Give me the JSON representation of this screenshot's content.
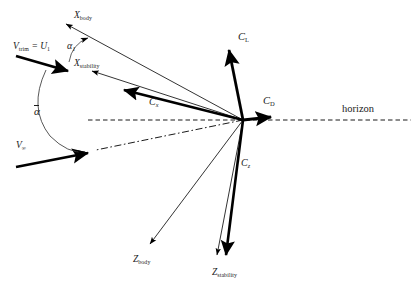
{
  "figure": {
    "origin": {
      "x": 243,
      "y": 120
    },
    "background": "#ffffff",
    "stroke_color": "#000000",
    "text_color": "#1a1a1a"
  },
  "labels": {
    "x_body": {
      "text": "X",
      "sub": "body",
      "x": 74,
      "y": 11
    },
    "x_stability": {
      "text": "X",
      "sub": "stability",
      "x": 74,
      "y": 59
    },
    "v_trim": {
      "text": "V",
      "sub": "trim",
      "eq": " = ",
      "second": "U",
      "sub2": "1",
      "x": 13,
      "y": 42
    },
    "v_inf": {
      "text": "V",
      "sub": "∞",
      "x": 16,
      "y": 141
    },
    "alpha_1": {
      "text": "α",
      "sub": "1",
      "x": 67,
      "y": 41
    },
    "alpha_bar": {
      "text": "α",
      "x": 34,
      "y": 106
    },
    "c_x": {
      "text": "C",
      "sub": "x",
      "x": 149,
      "y": 97
    },
    "c_l": {
      "text": "C",
      "sub": "L",
      "x": 238,
      "y": 32
    },
    "c_d": {
      "text": "C",
      "sub": "D",
      "x": 263,
      "y": 96
    },
    "c_z": {
      "text": "C",
      "sub": "z",
      "x": 241,
      "y": 158
    },
    "z_body": {
      "text": "Z",
      "sub": "body",
      "x": 133,
      "y": 255
    },
    "z_stability": {
      "text": "Z",
      "sub": "stability",
      "x": 212,
      "y": 268
    },
    "horizon": {
      "text": "horizon",
      "x": 342,
      "y": 104
    }
  },
  "vectors": {
    "thick": [
      {
        "name": "v-trim-vector",
        "x1": 16,
        "y1": 56,
        "x2": 73,
        "y2": 73,
        "label": "V_trim = U_1"
      },
      {
        "name": "v-infinity-vector",
        "x1": 16,
        "y1": 167,
        "x2": 93,
        "y2": 152,
        "label": "V_inf"
      },
      {
        "name": "cx-vector",
        "x1": 243,
        "y1": 120,
        "x2": 117,
        "y2": 88,
        "label": "C_x"
      },
      {
        "name": "cl-vector",
        "x1": 243,
        "y1": 120,
        "x2": 228,
        "y2": 44,
        "label": "C_L"
      },
      {
        "name": "cd-vector",
        "x1": 243,
        "y1": 120,
        "x2": 276,
        "y2": 117,
        "label": "C_D"
      },
      {
        "name": "cz-vector",
        "x1": 243,
        "y1": 120,
        "x2": 225,
        "y2": 263,
        "label": "C_z"
      }
    ],
    "thin": [
      {
        "name": "x-body-axis",
        "x1": 243,
        "y1": 120,
        "x2": 62,
        "y2": 22,
        "label": "X_body"
      },
      {
        "name": "x-stability-axis",
        "x1": 243,
        "y1": 120,
        "x2": 88,
        "y2": 70,
        "label": "X_stability"
      },
      {
        "name": "z-body-axis",
        "x1": 243,
        "y1": 120,
        "x2": 152,
        "y2": 248,
        "label": "Z_body"
      },
      {
        "name": "z-stability-axis",
        "x1": 243,
        "y1": 120,
        "x2": 218,
        "y2": 259,
        "label": "Z_stability"
      }
    ],
    "dashed_horizon": {
      "name": "horizon-line",
      "x1": 88,
      "y1": 120,
      "x2": 411,
      "y2": 120
    },
    "dash_dot_relative_wind": {
      "name": "relative-wind-line",
      "x1": 243,
      "y1": 120,
      "x2": 96,
      "y2": 150
    }
  },
  "arcs": [
    {
      "name": "alpha-1-arc",
      "label": "α₁",
      "from": {
        "x": 69,
        "y": 60
      },
      "to": {
        "x": 90,
        "y": 37
      }
    },
    {
      "name": "alpha-bar-arc",
      "label": "ᾱ",
      "from": {
        "x": 45,
        "y": 70
      },
      "to": {
        "x": 86,
        "y": 156
      }
    }
  ]
}
